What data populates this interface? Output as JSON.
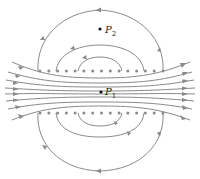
{
  "diagram": {
    "colors": {
      "field_line": "#8a8a8a",
      "wire_dot": "#8a8a8a",
      "point": "#111111",
      "background": "#ffffff"
    },
    "points": [
      {
        "id": "P2",
        "label": "P",
        "subscript": "2",
        "x": 100,
        "y": 29
      },
      {
        "id": "P1",
        "label": "P",
        "subscript": "1",
        "x": 101,
        "y": 92
      }
    ],
    "wire_rows": {
      "top_y": 71,
      "bottom_y": 113,
      "count": 15,
      "x_start": 40,
      "x_end": 163
    },
    "field_line_direction": "left-to-right inside solenoid; returning right-to-left outside"
  }
}
